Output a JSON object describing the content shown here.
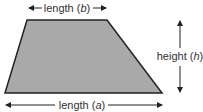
{
  "diagram": {
    "shape": "trapezoid",
    "fill_color": "#a9a9a9",
    "stroke_color": "#222222",
    "labels": {
      "top": {
        "text": "length (",
        "var": "b",
        "close": ")"
      },
      "bottom": {
        "text": "length (",
        "var": "a",
        "close": ")"
      },
      "right_top": {
        "text": "height (",
        "var": "h",
        "close": ")"
      }
    }
  }
}
